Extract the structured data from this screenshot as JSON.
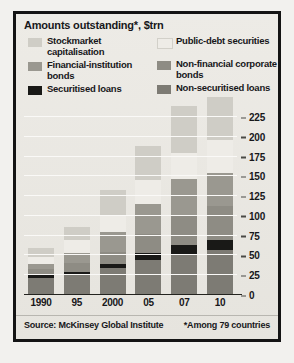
{
  "chart": {
    "title": "Amounts outstanding*, $trn",
    "source": "Source: McKinsey Global Institute",
    "footnote": "*Among 79 countries"
  },
  "legend": {
    "left": [
      {
        "label": "Stockmarket capitalisation",
        "color": "#cfcdc6",
        "key": "stockmarket_capitalisation"
      },
      {
        "label": "Financial-institution bonds",
        "color": "#9a9890",
        "key": "financial_institution_bonds"
      },
      {
        "label": "Securitised loans",
        "color": "#191917",
        "key": "securitised_loans"
      }
    ],
    "right": [
      {
        "label": "Public-debt securities",
        "color": "#eeece7",
        "key": "public_debt_securities"
      },
      {
        "label": "Non-financial corporate bonds",
        "color": "#8e8c84",
        "key": "non_financial_corporate_bonds"
      },
      {
        "label": "Non-securitised loans",
        "color": "#7d7b74",
        "key": "non_securitised_loans"
      }
    ]
  },
  "chart_data": {
    "type": "bar",
    "subtype": "stacked-bar",
    "title": "Amounts outstanding*, $trn",
    "xlabel": "",
    "ylabel": "",
    "ylim": [
      0,
      225
    ],
    "yticks": [
      0,
      25,
      50,
      75,
      100,
      125,
      150,
      175,
      200,
      225
    ],
    "ytick_labels": [
      "0",
      "25",
      "50",
      "75",
      "100",
      "125",
      "150",
      "175",
      "200",
      "225"
    ],
    "grid": true,
    "legend_position": "top",
    "categories": [
      "1990",
      "95",
      "2000",
      "05",
      "07",
      "10"
    ],
    "stack_order_bottom_to_top": [
      "Non-securitised loans",
      "Securitised loans",
      "Non-financial corporate bonds",
      "Financial-institution bonds",
      "Public-debt securities",
      "Stockmarket capitalisation"
    ],
    "series": [
      {
        "name": "Non-securitised loans",
        "color": "#7d7b74",
        "values": [
          22,
          26,
          34,
          44,
          52,
          57
        ]
      },
      {
        "name": "Securitised loans",
        "color": "#191917",
        "values": [
          3,
          3,
          5,
          9,
          11,
          12
        ]
      },
      {
        "name": "Non-financial corporate bonds",
        "color": "#8e8c84",
        "values": [
          8,
          11,
          16,
          24,
          38,
          43
        ]
      },
      {
        "name": "Financial-institution bonds",
        "color": "#9a9890",
        "values": [
          6,
          13,
          25,
          38,
          46,
          42
        ]
      },
      {
        "name": "Public-debt securities",
        "color": "#eeece7",
        "values": [
          9,
          16,
          21,
          30,
          32,
          42
        ]
      },
      {
        "name": "Stockmarket capitalisation",
        "color": "#cfcdc6",
        "values": [
          12,
          17,
          32,
          44,
          60,
          54
        ]
      }
    ],
    "totals": [
      60,
      86,
      133,
      189,
      239,
      250
    ]
  }
}
